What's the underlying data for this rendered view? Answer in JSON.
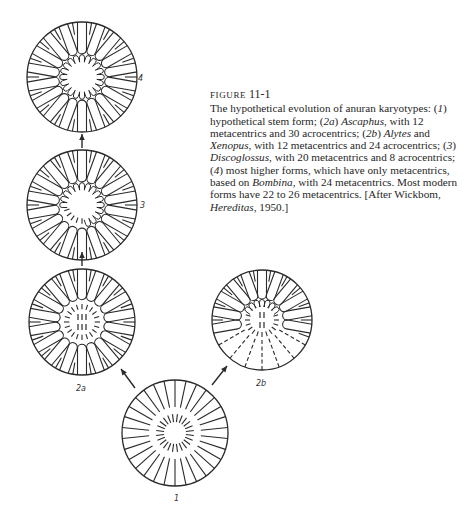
{
  "figure": {
    "label_word": "FIGURE",
    "label_number": "11-1",
    "caption_parts": [
      {
        "text": "The hypothetical evolution of anuran karyotypes: (",
        "italic": false
      },
      {
        "text": "1",
        "italic": true
      },
      {
        "text": ") hypothetical stem form; (",
        "italic": false
      },
      {
        "text": "2a",
        "italic": true
      },
      {
        "text": ") ",
        "italic": false
      },
      {
        "text": "Ascaphus",
        "italic": true
      },
      {
        "text": ", with 12 metacentrics and 30 acrocentrics; (",
        "italic": false
      },
      {
        "text": "2b",
        "italic": true
      },
      {
        "text": ") ",
        "italic": false
      },
      {
        "text": "Alytes",
        "italic": true
      },
      {
        "text": " and ",
        "italic": false
      },
      {
        "text": "Xenopus",
        "italic": true
      },
      {
        "text": ", with 12 metacentrics and 24 acrocentrics; (",
        "italic": false
      },
      {
        "text": "3",
        "italic": true
      },
      {
        "text": ") ",
        "italic": false
      },
      {
        "text": "Discoglossus",
        "italic": true
      },
      {
        "text": ", with 20 metacentrics and 8 acrocentrics; (",
        "italic": false
      },
      {
        "text": "4",
        "italic": true
      },
      {
        "text": ") most higher forms, which have only metacentrics, based on ",
        "italic": false
      },
      {
        "text": "Bombina",
        "italic": true
      },
      {
        "text": ", with 24 metacentrics. Most modern forms have 22 to 26 metacentrics. [After Wickbom, ",
        "italic": false
      },
      {
        "text": "Hereditas",
        "italic": true
      },
      {
        "text": ", 1950.]",
        "italic": false
      }
    ]
  },
  "stages": [
    {
      "id": "4",
      "label": "4",
      "cx": 82,
      "cy": 77,
      "r": 55,
      "type": "all-meta",
      "label_x": 138,
      "label_y": 74
    },
    {
      "id": "3",
      "label": "3",
      "cx": 82,
      "cy": 205,
      "r": 55,
      "type": "discoglossus",
      "label_x": 140,
      "label_y": 201
    },
    {
      "id": "2a",
      "label": "2a",
      "cx": 82,
      "cy": 322,
      "r": 53,
      "type": "ascaphus",
      "label_x": 76,
      "label_y": 384
    },
    {
      "id": "2b",
      "label": "2b",
      "cx": 262,
      "cy": 320,
      "r": 50,
      "type": "alytes",
      "label_x": 256,
      "label_y": 379
    },
    {
      "id": "1",
      "label": "1",
      "cx": 175,
      "cy": 433,
      "r": 53,
      "type": "stem",
      "label_x": 174,
      "label_y": 494
    }
  ],
  "arrows": [
    {
      "from": "3",
      "to": "4",
      "x1": 82,
      "y1": 148,
      "x2": 82,
      "y2": 134
    },
    {
      "from": "2a",
      "to": "3",
      "x1": 82,
      "y1": 266,
      "x2": 82,
      "y2": 252
    },
    {
      "from": "1",
      "to": "2a",
      "x1": 135,
      "y1": 388,
      "x2": 121,
      "y2": 369
    },
    {
      "from": "1",
      "to": "2b",
      "x1": 212,
      "y1": 385,
      "x2": 227,
      "y2": 366
    }
  ]
}
